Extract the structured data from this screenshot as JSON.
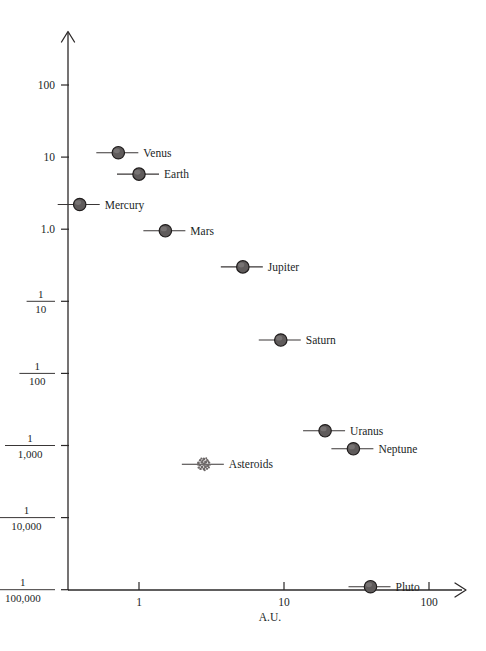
{
  "chart_data": {
    "type": "scatter",
    "title": "",
    "xlabel": "A.U.",
    "ylabel": "",
    "xscale": "log",
    "yscale": "log",
    "xlim": [
      0.35,
      160
    ],
    "ylim": [
      1e-05,
      300
    ],
    "grid": false,
    "legend": "none",
    "x_ticks": [
      {
        "value": 1,
        "label": "1"
      },
      {
        "value": 10,
        "label": "10"
      },
      {
        "value": 100,
        "label": "100"
      }
    ],
    "y_ticks": [
      {
        "value": 100,
        "label": "100",
        "is_fraction": false
      },
      {
        "value": 10,
        "label": "10",
        "is_fraction": false
      },
      {
        "value": 1.0,
        "label": "1.0",
        "is_fraction": false
      },
      {
        "value": 0.1,
        "label": "1/10",
        "is_fraction": true,
        "numerator": "1",
        "denominator": "10"
      },
      {
        "value": 0.01,
        "label": "1/100",
        "is_fraction": true,
        "numerator": "1",
        "denominator": "100"
      },
      {
        "value": 0.001,
        "label": "1/1,000",
        "is_fraction": true,
        "numerator": "1",
        "denominator": "1,000"
      },
      {
        "value": 0.0001,
        "label": "1/10,000",
        "is_fraction": true,
        "numerator": "1",
        "denominator": "10,000"
      },
      {
        "value": 1e-05,
        "label": "1/100,000",
        "is_fraction": true,
        "numerator": "1",
        "denominator": "100,000"
      }
    ],
    "points": [
      {
        "name": "Mercury",
        "x": 0.39,
        "y": 2.2,
        "label_side": "right",
        "marker": "disc"
      },
      {
        "name": "Venus",
        "x": 0.72,
        "y": 11.5,
        "label_side": "right",
        "marker": "disc"
      },
      {
        "name": "Earth",
        "x": 1.0,
        "y": 5.8,
        "label_side": "right",
        "marker": "disc"
      },
      {
        "name": "Mars",
        "x": 1.52,
        "y": 0.95,
        "label_side": "right",
        "marker": "disc"
      },
      {
        "name": "Asteroids",
        "x": 2.8,
        "y": 0.00055,
        "label_side": "right",
        "marker": "cluster"
      },
      {
        "name": "Jupiter",
        "x": 5.2,
        "y": 0.3,
        "label_side": "right",
        "marker": "disc"
      },
      {
        "name": "Saturn",
        "x": 9.5,
        "y": 0.029,
        "label_side": "right",
        "marker": "disc"
      },
      {
        "name": "Uranus",
        "x": 19.2,
        "y": 0.0016,
        "label_side": "right",
        "marker": "disc"
      },
      {
        "name": "Neptune",
        "x": 30.1,
        "y": 0.0009,
        "label_side": "right",
        "marker": "disc"
      },
      {
        "name": "Pluto",
        "x": 39.5,
        "y": 1.1e-05,
        "label_side": "right",
        "marker": "disc"
      }
    ]
  },
  "colors": {
    "marker_fill": "#5f5b5b",
    "marker_stroke": "#1f1c1c",
    "axis": "#2b2828",
    "text": "#221f1f",
    "background": "#ffffff"
  }
}
